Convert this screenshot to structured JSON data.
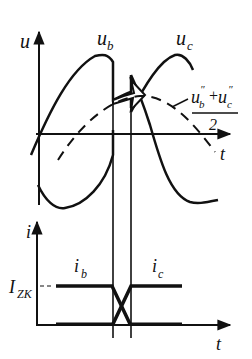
{
  "diagram": {
    "type": "commutation waveform diagram",
    "upper_plot": {
      "y_axis_label": "u",
      "x_axis_label": "t",
      "curves": [
        {
          "name": "u_b",
          "label": "u",
          "subscript": "b",
          "style": "solid"
        },
        {
          "name": "u_c",
          "label": "u",
          "subscript": "c",
          "style": "solid"
        },
        {
          "name": "avg",
          "label_numerator": "u″b + u″c",
          "label_denominator": "2",
          "style": "dashed"
        }
      ],
      "numerator_parts": {
        "u1": "u",
        "s1": "b",
        "plus": "+",
        "u2": "u",
        "s2": "c",
        "prime": "″"
      }
    },
    "lower_plot": {
      "y_axis_label": "i",
      "x_axis_label": "t",
      "level_label_main": "I",
      "level_label_sub": "ZK",
      "curves": [
        {
          "name": "i_b",
          "label": "i",
          "subscript": "b"
        },
        {
          "name": "i_c",
          "label": "i",
          "subscript": "c"
        }
      ]
    }
  }
}
